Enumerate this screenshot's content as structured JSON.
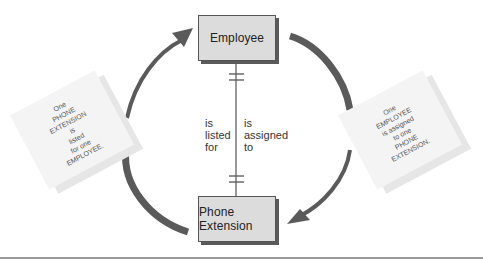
{
  "diagram": {
    "type": "entity-relationship",
    "entities": [
      {
        "id": "employee",
        "label": "Employee"
      },
      {
        "id": "phone_extension",
        "label": "Phone Extension"
      }
    ],
    "relationship": {
      "cardinality_top": "one-and-only-one",
      "cardinality_bottom": "one-and-only-one",
      "left_label": {
        "line1": "is",
        "line2": "listed",
        "line3": "for"
      },
      "right_label": {
        "line1": "is",
        "line2": "assigned",
        "line3": "to"
      }
    },
    "notes": {
      "left": "One\nPHONE\nEXTENSION\nis\nlisted\nfor one\nEMPLOYEE.",
      "right": "One\nEMPLOYEE\nis assigned\nto one\nPHONE\nEXTENSION."
    },
    "arrows": [
      {
        "from": "phone_extension",
        "to": "employee",
        "side": "left",
        "direction": "up"
      },
      {
        "from": "employee",
        "to": "phone_extension",
        "side": "right",
        "direction": "down"
      }
    ]
  },
  "colors": {
    "entity_fill": "#dcdcdc",
    "entity_shadow": "#5a5a5a",
    "arrow": "#555555",
    "note_fill": "#f4f4f4",
    "rule": "#9a9a9a"
  }
}
